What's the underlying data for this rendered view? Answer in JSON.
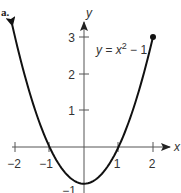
{
  "figure": {
    "part_label": "a."
  },
  "chart_data": {
    "type": "line",
    "title": "",
    "equation": "y = x² − 1",
    "equation_parts": {
      "lhs": "y = x",
      "exp": "2",
      "rhs": " − 1"
    },
    "xlabel": "x",
    "ylabel": "y",
    "xlim": [
      -2,
      2
    ],
    "ylim": [
      -1,
      3
    ],
    "x_ticks": [
      -2,
      -1,
      1,
      2
    ],
    "x_tick_labels": [
      "−2",
      "−1",
      "1",
      "2"
    ],
    "y_ticks": [
      1,
      2,
      3
    ],
    "y_tick_labels": [
      "1",
      "2",
      "3"
    ],
    "y_min_label": "−1",
    "grid": false,
    "legend": "none",
    "domain_note": "Curve extends to the left (arrow) and ends with a closed dot at (2, 3)",
    "series": [
      {
        "name": "y = x^2 - 1",
        "x": [
          -2,
          -1.5,
          -1,
          -0.5,
          0,
          0.5,
          1,
          1.5,
          2
        ],
        "y": [
          3,
          1.25,
          0,
          -0.75,
          -1,
          -0.75,
          0,
          1.25,
          3
        ]
      }
    ],
    "endpoints": {
      "left": {
        "x": -2,
        "y": 3,
        "style": "arrow"
      },
      "right": {
        "x": 2,
        "y": 3,
        "style": "closed-dot"
      }
    },
    "colors": {
      "curve": "#111111",
      "axes": "#555555",
      "text": "#333333"
    }
  }
}
